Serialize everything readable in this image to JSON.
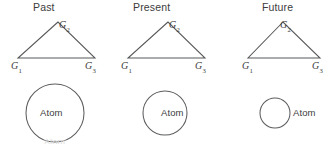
{
  "figure": {
    "name": "atom-evolution-diagram",
    "background_color": "#ffffff",
    "stroke_color": "#57585a",
    "text_color": "#3c3c3c",
    "bottom_artifact_text": "Atom"
  },
  "panels": [
    {
      "id": "past",
      "title": "Past",
      "triangle": {
        "apex_label": "G",
        "apex_sub": "2",
        "left_label": "G",
        "left_sub": "1",
        "right_label": "G",
        "right_sub": "3",
        "points": "58,10 18,46 95,46"
      },
      "atom": {
        "label": "Atom",
        "label_position": "inside",
        "cx": 55,
        "cy": 31,
        "r": 29
      }
    },
    {
      "id": "present",
      "title": "Present",
      "triangle": {
        "apex_label": "G",
        "apex_sub": "2",
        "left_label": "G",
        "left_sub": "1",
        "right_label": "G",
        "right_sub": "3",
        "points": "58,10 18,46 95,46"
      },
      "atom": {
        "label": "Atom",
        "label_position": "inside",
        "cx": 55,
        "cy": 31,
        "r": 22
      }
    },
    {
      "id": "future",
      "title": "Future",
      "triangle": {
        "apex_label": "G",
        "apex_sub": "2",
        "left_label": "G",
        "left_sub": "1",
        "right_label": "G",
        "right_sub": "3",
        "points": "63,10 28,46 100,46"
      },
      "atom": {
        "label": "Atom",
        "label_position": "outside-right",
        "cx": 55,
        "cy": 31,
        "r": 15
      }
    }
  ]
}
